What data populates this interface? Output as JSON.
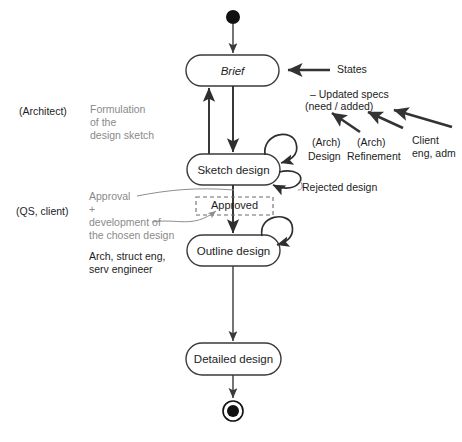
{
  "diagram": {
    "type": "uml-state-diagram",
    "canvas": {
      "width": 462,
      "height": 442
    },
    "colors": {
      "background": "#ffffff",
      "state_stroke": "#3a3a3a",
      "flow_stroke": "#2e2e2e",
      "dashed_stroke": "#6b6b6b",
      "gray_text": "#8a8a8a",
      "dark_text": "#1d1d1d",
      "mid_text": "#4a4a4a"
    }
  },
  "nodes": {
    "initial": {
      "name": "initial-state",
      "shape": "filled-circle",
      "cx": 233,
      "cy": 17,
      "r": 7
    },
    "brief": {
      "label": "Brief",
      "italic": true,
      "x": 186,
      "y": 55,
      "w": 93,
      "h": 31
    },
    "sketch": {
      "label": "Sketch design",
      "italic": false,
      "x": 187,
      "y": 154,
      "w": 93,
      "h": 31
    },
    "approved": {
      "label": "Approved",
      "x": 196,
      "y": 197,
      "w": 77,
      "h": 18,
      "dashed": true
    },
    "outline": {
      "label": "Outline design",
      "italic": false,
      "x": 187,
      "y": 235,
      "w": 93,
      "h": 31
    },
    "detailed": {
      "label": "Detailed design",
      "italic": false,
      "x": 186,
      "y": 343,
      "w": 95,
      "h": 32
    },
    "final": {
      "name": "final-state",
      "shape": "ringed-circle",
      "cx": 233,
      "cy": 411,
      "r_outer": 10,
      "r_inner": 6
    }
  },
  "annotations": {
    "states_callout": "States",
    "updated_specs_line1": "– Updated specs",
    "updated_specs_line2": "(need / added)",
    "arch_design_line1": "(Arch)",
    "arch_design_line2": "Design",
    "arch_refinement_line1": "(Arch)",
    "arch_refinement_line2": "Refinement",
    "client_line1": "Client",
    "client_line2": "eng, adm",
    "rejected_design": "Rejected design",
    "architect_role": "(Architect)",
    "formulation_line1": "Formulation",
    "formulation_line2": "of the",
    "formulation_line3": "design sketch",
    "qs_client_role": "(QS, client)",
    "approval_line1": "Approval",
    "approval_line2": "+",
    "approval_line3": "development of",
    "approval_line4": "the chosen design",
    "team_line1": "Arch, struct eng,",
    "team_line2": "serv engineer"
  }
}
